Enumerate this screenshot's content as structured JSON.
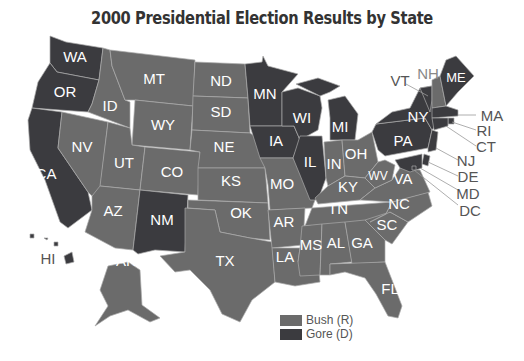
{
  "title": "2000 Presidential Election Results by State",
  "colors": {
    "bush": "#6b6b6b",
    "gore": "#3b3b3f",
    "border": "#aaaaaa"
  },
  "legend": [
    {
      "label": "Bush (R)",
      "color": "#6b6b6b"
    },
    {
      "label": "Gore (D)",
      "color": "#3b3b3f"
    }
  ],
  "states": [
    {
      "abbr": "WA",
      "winner": "Gore"
    },
    {
      "abbr": "OR",
      "winner": "Gore"
    },
    {
      "abbr": "CA",
      "winner": "Gore"
    },
    {
      "abbr": "ID",
      "winner": "Bush"
    },
    {
      "abbr": "NV",
      "winner": "Bush"
    },
    {
      "abbr": "MT",
      "winner": "Bush"
    },
    {
      "abbr": "WY",
      "winner": "Bush"
    },
    {
      "abbr": "UT",
      "winner": "Bush"
    },
    {
      "abbr": "CO",
      "winner": "Bush"
    },
    {
      "abbr": "AZ",
      "winner": "Bush"
    },
    {
      "abbr": "NM",
      "winner": "Gore"
    },
    {
      "abbr": "ND",
      "winner": "Bush"
    },
    {
      "abbr": "SD",
      "winner": "Bush"
    },
    {
      "abbr": "NE",
      "winner": "Bush"
    },
    {
      "abbr": "KS",
      "winner": "Bush"
    },
    {
      "abbr": "OK",
      "winner": "Bush"
    },
    {
      "abbr": "TX",
      "winner": "Bush"
    },
    {
      "abbr": "MN",
      "winner": "Gore"
    },
    {
      "abbr": "IA",
      "winner": "Gore"
    },
    {
      "abbr": "MO",
      "winner": "Bush"
    },
    {
      "abbr": "AR",
      "winner": "Bush"
    },
    {
      "abbr": "LA",
      "winner": "Bush"
    },
    {
      "abbr": "WI",
      "winner": "Gore"
    },
    {
      "abbr": "IL",
      "winner": "Gore"
    },
    {
      "abbr": "MI",
      "winner": "Gore"
    },
    {
      "abbr": "IN",
      "winner": "Bush"
    },
    {
      "abbr": "OH",
      "winner": "Bush"
    },
    {
      "abbr": "KY",
      "winner": "Bush"
    },
    {
      "abbr": "TN",
      "winner": "Bush"
    },
    {
      "abbr": "MS",
      "winner": "Bush"
    },
    {
      "abbr": "AL",
      "winner": "Bush"
    },
    {
      "abbr": "GA",
      "winner": "Bush"
    },
    {
      "abbr": "FL",
      "winner": "Bush"
    },
    {
      "abbr": "SC",
      "winner": "Bush"
    },
    {
      "abbr": "NC",
      "winner": "Bush"
    },
    {
      "abbr": "VA",
      "winner": "Bush"
    },
    {
      "abbr": "WV",
      "winner": "Bush"
    },
    {
      "abbr": "PA",
      "winner": "Gore"
    },
    {
      "abbr": "NY",
      "winner": "Gore"
    },
    {
      "abbr": "VT",
      "winner": "Gore"
    },
    {
      "abbr": "NH",
      "winner": "Bush"
    },
    {
      "abbr": "ME",
      "winner": "Gore"
    },
    {
      "abbr": "MA",
      "winner": "Gore"
    },
    {
      "abbr": "RI",
      "winner": "Gore"
    },
    {
      "abbr": "CT",
      "winner": "Gore"
    },
    {
      "abbr": "NJ",
      "winner": "Gore"
    },
    {
      "abbr": "DE",
      "winner": "Gore"
    },
    {
      "abbr": "MD",
      "winner": "Gore"
    },
    {
      "abbr": "DC",
      "winner": "Gore"
    },
    {
      "abbr": "AK",
      "winner": "Bush"
    },
    {
      "abbr": "HI",
      "winner": "Gore"
    }
  ],
  "labels": {
    "WA": "WA",
    "OR": "OR",
    "CA": "CA",
    "ID": "ID",
    "NV": "NV",
    "MT": "MT",
    "WY": "WY",
    "UT": "UT",
    "CO": "CO",
    "AZ": "AZ",
    "NM": "NM",
    "ND": "ND",
    "SD": "SD",
    "NE": "NE",
    "KS": "KS",
    "OK": "OK",
    "TX": "TX",
    "MN": "MN",
    "IA": "IA",
    "MO": "MO",
    "AR": "AR",
    "LA": "LA",
    "WI": "WI",
    "IL": "IL",
    "MI": "MI",
    "IN": "IN",
    "OH": "OH",
    "KY": "KY",
    "TN": "TN",
    "MS": "MS",
    "AL": "AL",
    "GA": "GA",
    "FL": "FL",
    "SC": "SC",
    "NC": "NC",
    "VA": "VA",
    "WV": "WV",
    "PA": "PA",
    "NY": "NY",
    "VT": "VT",
    "NH": "NH",
    "ME": "ME",
    "MA": "MA",
    "RI": "RI",
    "CT": "CT",
    "NJ": "NJ",
    "DE": "DE",
    "MD": "MD",
    "DC": "DC",
    "AK": "AK",
    "HI": "HI"
  }
}
